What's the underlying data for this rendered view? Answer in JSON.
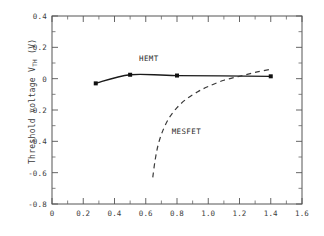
{
  "chart_data": {
    "type": "line",
    "title": "",
    "xlabel": "",
    "ylabel": "Threshold voltage V_TH (V)",
    "ylabel_main": "Threshold voltage V",
    "ylabel_sub": "TH",
    "ylabel_unit": " (V)",
    "xlim": [
      0,
      1.6
    ],
    "ylim": [
      -0.8,
      0.4
    ],
    "xticks": [
      0,
      0.2,
      0.4,
      0.6,
      0.8,
      1.0,
      1.2,
      1.4,
      1.6
    ],
    "xticklabels": [
      "0",
      "0.2",
      "0.4",
      "0.6",
      "0.8",
      "1.0",
      "1.2",
      "1.4",
      "1.6"
    ],
    "yticks": [
      -0.8,
      -0.6,
      -0.4,
      -0.2,
      0,
      0.2,
      0.4
    ],
    "yticklabels": [
      "-0.8",
      "-0.6",
      "-0.4",
      "-0.2",
      "0",
      "0.2",
      "0.4"
    ],
    "minor_tick_interval_x": 0.1,
    "minor_tick_interval_y": 0.1,
    "grid": false,
    "legend_position": "inline-annotations",
    "series": [
      {
        "name": "HEMT",
        "style": "solid",
        "markers": "square",
        "x": [
          0.28,
          0.5,
          0.8,
          1.4
        ],
        "values": [
          -0.03,
          0.025,
          0.02,
          0.015
        ],
        "label_x": 0.62,
        "label_y": 0.115
      },
      {
        "name": "MESFET",
        "style": "dashed",
        "markers": "none",
        "x": [
          0.645,
          0.66,
          0.68,
          0.71,
          0.75,
          0.8,
          0.86,
          0.93,
          1.0,
          1.1,
          1.2,
          1.3,
          1.4
        ],
        "values": [
          -0.63,
          -0.52,
          -0.42,
          -0.33,
          -0.25,
          -0.185,
          -0.13,
          -0.085,
          -0.05,
          -0.01,
          0.015,
          0.04,
          0.06
        ],
        "label_x": 0.86,
        "label_y": -0.355
      }
    ]
  },
  "annotations": {
    "hemt_label": "HEMT",
    "mesfet_label": "MESFET"
  }
}
